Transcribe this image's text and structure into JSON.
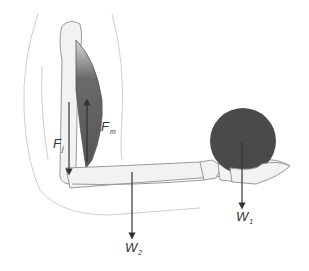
{
  "diagram": {
    "labels": {
      "muscle_force": {
        "symbol": "F",
        "subscript": "m"
      },
      "joint_force": {
        "symbol": "F",
        "subscript": "j"
      },
      "ball_weight": {
        "symbol": "W",
        "subscript": "1"
      },
      "forearm_weight": {
        "symbol": "W",
        "subscript": "2"
      }
    },
    "colors": {
      "ball": "#4a4a4a",
      "muscle": "#5c5c5c",
      "bone_outline": "#9a9a9a",
      "bone_fill": "#f2f2f2",
      "body_outline": "#c8c8c8",
      "arrow": "#333333"
    }
  }
}
